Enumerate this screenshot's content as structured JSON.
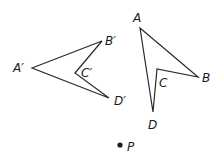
{
  "diagram": {
    "figure_image": {
      "name": "A'B'C'D'",
      "vertices": {
        "A": {
          "label": "A′",
          "x": 32,
          "y": 68
        },
        "B": {
          "label": "B′",
          "x": 102,
          "y": 41
        },
        "C": {
          "label": "C′",
          "x": 75,
          "y": 73
        },
        "D": {
          "label": "D′",
          "x": 109,
          "y": 98
        }
      }
    },
    "figure_original": {
      "name": "ABCD",
      "vertices": {
        "A": {
          "label": "A",
          "x": 140,
          "y": 28
        },
        "B": {
          "label": "B",
          "x": 198,
          "y": 77
        },
        "C": {
          "label": "C",
          "x": 157,
          "y": 69
        },
        "D": {
          "label": "D",
          "x": 153,
          "y": 112
        }
      }
    },
    "point_p": {
      "label": "P",
      "x": 120,
      "y": 145
    },
    "stroke_color": "#2a2a2a"
  }
}
